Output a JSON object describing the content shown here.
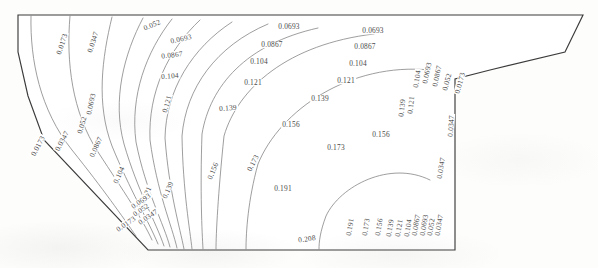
{
  "figure": {
    "kind": "contour-plot",
    "line_color": "#7e7e7e",
    "boundary_color": "#3b3b3b",
    "background_color": "#fdfdfb",
    "label_color": "#4a4a4a"
  },
  "chart_data": {
    "type": "line",
    "title": "",
    "subtitle": "",
    "xlabel": "",
    "ylabel": "",
    "grid": false,
    "legend": "none",
    "axis_ticks": [],
    "tick_labels": [],
    "levels": [
      0.0173,
      0.0347,
      0.052,
      0.0693,
      0.0867,
      0.104,
      0.121,
      0.139,
      0.156,
      0.173,
      0.191,
      0.208
    ],
    "level_count": 12,
    "level_min": 0.0173,
    "level_max": 0.208,
    "level_step": 0.0173,
    "series": [
      {
        "name": "0.0173",
        "value": 0.0173
      },
      {
        "name": "0.0347",
        "value": 0.0347
      },
      {
        "name": "0.052",
        "value": 0.052
      },
      {
        "name": "0.0693",
        "value": 0.0693
      },
      {
        "name": "0.0867",
        "value": 0.0867
      },
      {
        "name": "0.104",
        "value": 0.104
      },
      {
        "name": "0.121",
        "value": 0.121
      },
      {
        "name": "0.139",
        "value": 0.139
      },
      {
        "name": "0.156",
        "value": 0.156
      },
      {
        "name": "0.173",
        "value": 0.173
      },
      {
        "name": "0.191",
        "value": 0.191
      },
      {
        "name": "0.208",
        "value": 0.208
      }
    ]
  },
  "labels": [
    {
      "text": "0.0173",
      "x": 62,
      "y": 44,
      "rot": -72
    },
    {
      "text": "0.0347",
      "x": 93,
      "y": 42,
      "rot": -72
    },
    {
      "text": "0.052",
      "x": 152,
      "y": 25,
      "rot": -22
    },
    {
      "text": "0.0693",
      "x": 181,
      "y": 39,
      "rot": -12
    },
    {
      "text": "0.0693",
      "x": 289,
      "y": 27,
      "rot": 0
    },
    {
      "text": "0.0693",
      "x": 373,
      "y": 31,
      "rot": 0
    },
    {
      "text": "0.0867",
      "x": 172,
      "y": 55,
      "rot": -6
    },
    {
      "text": "0.0867",
      "x": 272,
      "y": 45,
      "rot": 0
    },
    {
      "text": "0.0867",
      "x": 365,
      "y": 47,
      "rot": 0
    },
    {
      "text": "0.104",
      "x": 170,
      "y": 76,
      "rot": -4
    },
    {
      "text": "0.104",
      "x": 259,
      "y": 62,
      "rot": 0
    },
    {
      "text": "0.104",
      "x": 358,
      "y": 64,
      "rot": 0
    },
    {
      "text": "0.121",
      "x": 167,
      "y": 104,
      "rot": -74
    },
    {
      "text": "0.121",
      "x": 253,
      "y": 83,
      "rot": 0
    },
    {
      "text": "0.121",
      "x": 346,
      "y": 81,
      "rot": 0
    },
    {
      "text": "0.139",
      "x": 228,
      "y": 108,
      "rot": -4
    },
    {
      "text": "0.139",
      "x": 320,
      "y": 99,
      "rot": 0
    },
    {
      "text": "0.156",
      "x": 213,
      "y": 171,
      "rot": -68
    },
    {
      "text": "0.156",
      "x": 291,
      "y": 125,
      "rot": 0
    },
    {
      "text": "0.156",
      "x": 381,
      "y": 135,
      "rot": 0
    },
    {
      "text": "0.173",
      "x": 253,
      "y": 163,
      "rot": -62
    },
    {
      "text": "0.173",
      "x": 336,
      "y": 148,
      "rot": 0
    },
    {
      "text": "0.191",
      "x": 283,
      "y": 189,
      "rot": 0
    },
    {
      "text": "0.208",
      "x": 307,
      "y": 239,
      "rot": -8
    },
    {
      "text": "0.0173",
      "x": 38,
      "y": 146,
      "rot": -62
    },
    {
      "text": "0.0347",
      "x": 62,
      "y": 141,
      "rot": -62
    },
    {
      "text": "0.0867",
      "x": 96,
      "y": 147,
      "rot": -66
    },
    {
      "text": "0.104",
      "x": 119,
      "y": 175,
      "rot": -66
    },
    {
      "text": "0.052",
      "x": 82,
      "y": 125,
      "rot": -74
    },
    {
      "text": "0.0693",
      "x": 91,
      "y": 104,
      "rot": -78
    },
    {
      "text": "0.121",
      "x": 146,
      "y": 195,
      "rot": -66
    },
    {
      "text": "0.139",
      "x": 168,
      "y": 190,
      "rot": -66
    },
    {
      "text": "0.0173",
      "x": 126,
      "y": 224,
      "rot": -34
    },
    {
      "text": "0.0347",
      "x": 148,
      "y": 217,
      "rot": -34
    },
    {
      "text": "0.052",
      "x": 141,
      "y": 210,
      "rot": -34
    },
    {
      "text": "0.0693",
      "x": 141,
      "y": 201,
      "rot": -34
    },
    {
      "text": "0.0173",
      "x": 460,
      "y": 83,
      "rot": -74
    },
    {
      "text": "0.052",
      "x": 447,
      "y": 82,
      "rot": -76
    },
    {
      "text": "0.0867",
      "x": 437,
      "y": 76,
      "rot": -78
    },
    {
      "text": "0.0693",
      "x": 427,
      "y": 73,
      "rot": -78
    },
    {
      "text": "0.104",
      "x": 417,
      "y": 79,
      "rot": -80
    },
    {
      "text": "0.121",
      "x": 411,
      "y": 105,
      "rot": -84
    },
    {
      "text": "0.139",
      "x": 402,
      "y": 108,
      "rot": -84
    },
    {
      "text": "0.0347",
      "x": 451,
      "y": 126,
      "rot": -86
    },
    {
      "text": "0.0347",
      "x": 441,
      "y": 168,
      "rot": -80
    },
    {
      "text": "0.191",
      "x": 350,
      "y": 227,
      "rot": -80
    },
    {
      "text": "0.173",
      "x": 366,
      "y": 227,
      "rot": -80
    },
    {
      "text": "0.156",
      "x": 379,
      "y": 227,
      "rot": -80
    },
    {
      "text": "0.139",
      "x": 390,
      "y": 228,
      "rot": -80
    },
    {
      "text": "0.121",
      "x": 399,
      "y": 228,
      "rot": -80
    },
    {
      "text": "0.104",
      "x": 408,
      "y": 228,
      "rot": -80
    },
    {
      "text": "0.0867",
      "x": 416,
      "y": 225,
      "rot": -80
    },
    {
      "text": "0.0693",
      "x": 424,
      "y": 225,
      "rot": -80
    },
    {
      "text": "0.052",
      "x": 431,
      "y": 227,
      "rot": -80
    },
    {
      "text": "0.0347",
      "x": 439,
      "y": 225,
      "rot": -80
    }
  ],
  "hull": {
    "outline_points": "18,15 583,15 565,52 490,70 455,79 455,250 148,250 44,140 28,96 18,52",
    "note": "outer boundary of the half section"
  },
  "contour_paths": [
    {
      "level": 0.0173,
      "d": "M 31,16 C 30,60 40,110 72,150 C 104,190 122,216 136,236"
    },
    {
      "level": 0.0347,
      "d": "M 70,16 C 66,62 72,112 98,152 C 124,192 142,218 152,240"
    },
    {
      "level": 0.052,
      "d": "M 112,17 C 102,58 96,104 112,146 C 130,190 148,220 158,244"
    },
    {
      "level": 0.0693,
      "d": "M 143,18 C 124,54 112,100 124,144 C 138,192 156,222 164,246"
    },
    {
      "level": 0.0867,
      "d": "M 172,19 C 146,52 130,96 136,142 C 146,192 164,224 170,247"
    },
    {
      "level": 0.104,
      "d": "M 200,20 C 168,50 148,92 150,140 C 157,192 172,226 177,248"
    },
    {
      "level": 0.121,
      "d": "M 232,22 C 192,48 166,90 165,138 C 169,192 180,228 184,249"
    },
    {
      "level": 0.139,
      "d": "M 268,24 C 216,46 186,88 182,136 C 183,192 190,230 192,249"
    },
    {
      "level": 0.156,
      "d": "M 318,28 C 246,44 210,86 202,134 C 200,192 202,232 203,249"
    },
    {
      "level": 0.173,
      "d": "M 374,34 C 288,44 238,88 224,136 C 218,194 216,234 216,249"
    },
    {
      "level": 0.191,
      "d": "M 430,70 C 350,62 280,110 258,164 C 248,200 246,232 246,249"
    },
    {
      "level": 0.208,
      "d": "M 430,180 C 390,160 340,186 326,216 C 320,232 319,242 319,249"
    }
  ]
}
